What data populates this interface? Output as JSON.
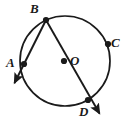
{
  "figure": {
    "background_color": "#ffffff",
    "stroke_color": "#1a1a1a",
    "labels": {
      "A": "A",
      "B": "B",
      "C": "C",
      "D": "D",
      "O": "O"
    },
    "geometry": {
      "circle": {
        "cx": 65,
        "cy": 61,
        "r": 45
      },
      "points": {
        "A": {
          "x": 24,
          "y": 64
        },
        "B": {
          "x": 46,
          "y": 20
        },
        "C": {
          "x": 108,
          "y": 44
        },
        "D": {
          "x": 88,
          "y": 100
        },
        "O": {
          "x": 64,
          "y": 61
        }
      },
      "rays": [
        {
          "name": "ray-B-A",
          "from": "B",
          "through": "A",
          "arrow_tip": {
            "x": 13,
            "y": 85
          }
        },
        {
          "name": "ray-B-O-D",
          "from": "B",
          "through": "D",
          "arrow_tip": {
            "x": 101,
            "y": 115
          }
        }
      ]
    }
  }
}
